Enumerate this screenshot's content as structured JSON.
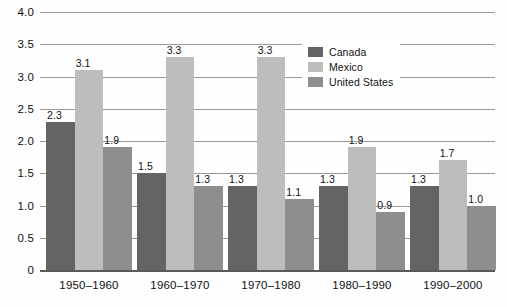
{
  "chart_data": {
    "type": "bar",
    "title": "",
    "subtitle": "",
    "xlabel": "",
    "ylabel": "",
    "ylim": [
      0,
      4.0
    ],
    "yticks": [
      "0",
      "0.5",
      "1.0",
      "1.5",
      "2.0",
      "2.5",
      "3.0",
      "3.5",
      "4.0"
    ],
    "ytick_values": [
      0,
      0.5,
      1.0,
      1.5,
      2.0,
      2.5,
      3.0,
      3.5,
      4.0
    ],
    "grid": "horizontal",
    "legend_position": "top-right-inside",
    "categories": [
      "1950–1960",
      "1960–1970",
      "1970–1980",
      "1980–1990",
      "1990–2000"
    ],
    "series": [
      {
        "name": "Canada",
        "color": "#646464",
        "values": [
          2.3,
          1.5,
          1.3,
          1.3,
          1.3
        ],
        "labels": [
          "2.3",
          "1.5",
          "1.3",
          "1.3",
          "1.3"
        ]
      },
      {
        "name": "Mexico",
        "color": "#bdbdbd",
        "values": [
          3.1,
          3.3,
          3.3,
          1.9,
          1.7
        ],
        "labels": [
          "3.1",
          "3.3",
          "3.3",
          "1.9",
          "1.7"
        ]
      },
      {
        "name": "United States",
        "color": "#8e8e8e",
        "values": [
          1.9,
          1.3,
          1.1,
          0.9,
          1.0
        ],
        "labels": [
          "1.9",
          "1.3",
          "1.1",
          "0.9",
          "1.0"
        ]
      }
    ]
  },
  "axis": {
    "y_tick_0": "0",
    "y_tick_1": "0.5",
    "y_tick_2": "1.0",
    "y_tick_3": "1.5",
    "y_tick_4": "2.0",
    "y_tick_5": "2.5",
    "y_tick_6": "3.0",
    "y_tick_7": "3.5",
    "y_tick_8": "4.0"
  },
  "legend": {
    "items": [
      {
        "label": "Canada",
        "color": "#646464"
      },
      {
        "label": "Mexico",
        "color": "#bdbdbd"
      },
      {
        "label": "United States",
        "color": "#8e8e8e"
      }
    ]
  },
  "colors": {
    "canada": "#646464",
    "mexico": "#bdbdbd",
    "united_states": "#8e8e8e",
    "gridline": "#9a9a9a",
    "axis": "#5a5a5a",
    "background": "#fefefe",
    "text": "#111111"
  }
}
